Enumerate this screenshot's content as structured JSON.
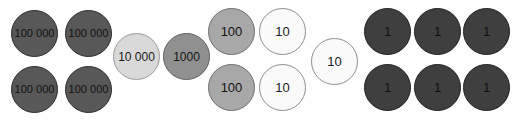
{
  "diagram": {
    "type": "place-value-counter-diagram",
    "background_color": "#ffffff",
    "counter_diameter": 47,
    "palette": {
      "hundred-thousand": {
        "fill": "#585858",
        "border": "#2b2b2b",
        "text": "#111111"
      },
      "ten-thousand": {
        "fill": "#d9d9d9",
        "border": "#9a9a9a",
        "text": "#1a1a1a"
      },
      "thousand": {
        "fill": "#909090",
        "border": "#5e5e5e",
        "text": "#141414"
      },
      "hundred": {
        "fill": "#a8a8a8",
        "border": "#6f6f6f",
        "text": "#141414"
      },
      "ten": {
        "fill": "#fafafa",
        "border": "#8e8e8e",
        "text": "#1a1a1a"
      },
      "one": {
        "fill": "#3f3f3f",
        "border": "#1f1f1f",
        "text": "#0d0d0d"
      }
    },
    "groups": [
      {
        "place": "hundred-thousand",
        "label": "100 000",
        "count": 4
      },
      {
        "place": "ten-thousand",
        "label": "10 000",
        "count": 1
      },
      {
        "place": "thousand",
        "label": "1000",
        "count": 1
      },
      {
        "place": "hundred",
        "label": "100",
        "count": 2
      },
      {
        "place": "ten",
        "label": "10",
        "count": 3
      },
      {
        "place": "one",
        "label": "1",
        "count": 6
      }
    ],
    "counters": [
      {
        "place": "hundred-thousand",
        "label": "100 000",
        "x": 11,
        "y": 10,
        "font_size": 11
      },
      {
        "place": "hundred-thousand",
        "label": "100 000",
        "x": 65,
        "y": 10,
        "font_size": 11
      },
      {
        "place": "hundred-thousand",
        "label": "100 000",
        "x": 11,
        "y": 66,
        "font_size": 11
      },
      {
        "place": "hundred-thousand",
        "label": "100 000",
        "x": 65,
        "y": 66,
        "font_size": 11
      },
      {
        "place": "ten-thousand",
        "label": "10 000",
        "x": 113,
        "y": 33,
        "font_size": 12
      },
      {
        "place": "thousand",
        "label": "1000",
        "x": 163,
        "y": 33,
        "font_size": 12
      },
      {
        "place": "hundred",
        "label": "100",
        "x": 208,
        "y": 8,
        "font_size": 13
      },
      {
        "place": "hundred",
        "label": "100",
        "x": 208,
        "y": 64,
        "font_size": 13
      },
      {
        "place": "ten",
        "label": "10",
        "x": 259,
        "y": 8,
        "font_size": 13
      },
      {
        "place": "ten",
        "label": "10",
        "x": 259,
        "y": 64,
        "font_size": 13
      },
      {
        "place": "ten",
        "label": "10",
        "x": 311,
        "y": 38,
        "font_size": 13
      },
      {
        "place": "one",
        "label": "1",
        "x": 364,
        "y": 8,
        "font_size": 13
      },
      {
        "place": "one",
        "label": "1",
        "x": 414,
        "y": 8,
        "font_size": 13
      },
      {
        "place": "one",
        "label": "1",
        "x": 463,
        "y": 8,
        "font_size": 13
      },
      {
        "place": "one",
        "label": "1",
        "x": 364,
        "y": 64,
        "font_size": 13
      },
      {
        "place": "one",
        "label": "1",
        "x": 414,
        "y": 64,
        "font_size": 13
      },
      {
        "place": "one",
        "label": "1",
        "x": 463,
        "y": 64,
        "font_size": 13
      }
    ]
  }
}
